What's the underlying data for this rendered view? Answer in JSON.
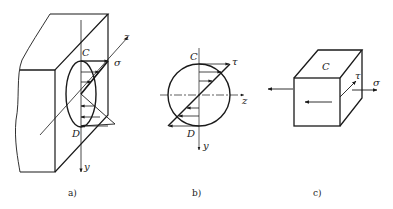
{
  "figure_a": {
    "caption": "a)",
    "labels": {
      "top_point": "C",
      "bottom_point": "D",
      "stress": "σ",
      "axis_z": "z",
      "axis_y": "y"
    }
  },
  "figure_b": {
    "caption": "b)",
    "labels": {
      "top_point": "C",
      "bottom_point": "D",
      "stress": "τ",
      "axis_z": "z",
      "axis_y": "y"
    }
  },
  "figure_c": {
    "caption": "c)",
    "labels": {
      "element": "C",
      "shear": "τ",
      "normal": "σ"
    }
  },
  "colors": {
    "line": "#1a1a1a",
    "background": "#ffffff"
  }
}
